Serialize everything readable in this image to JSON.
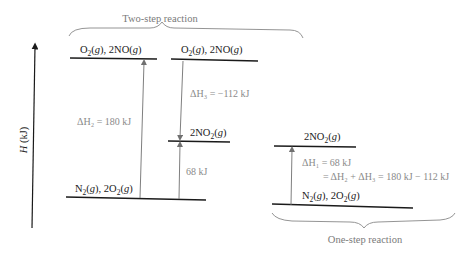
{
  "diagram": {
    "axis": {
      "label": "H (kJ)",
      "label_italic": "H",
      "label_rest": " (kJ)"
    },
    "two_step": {
      "caption": "Two-step reaction",
      "levels": [
        {
          "id": "top_left",
          "label_parts": [
            "O",
            "2",
            "(g), 2NO(g)"
          ]
        },
        {
          "id": "top_right",
          "label_parts": [
            "O",
            "2",
            "(g), 2NO(g)"
          ]
        },
        {
          "id": "mid",
          "label_parts": [
            "2NO",
            "2",
            "(g)"
          ]
        },
        {
          "id": "bottom",
          "label_parts": [
            "N",
            "2",
            "(g), 2O",
            "2",
            "(g)"
          ]
        }
      ],
      "arrows": [
        {
          "id": "dH2",
          "text": "ΔH₂ = 180 kJ",
          "value_kj": 180
        },
        {
          "id": "dH3",
          "text": "ΔH₃ = −112 kJ",
          "value_kj": -112
        },
        {
          "id": "net",
          "text": "68 kJ",
          "value_kj": 68
        }
      ]
    },
    "one_step": {
      "caption": "One-step reaction",
      "levels": [
        {
          "id": "top",
          "label_parts": [
            "2NO",
            "2",
            "(g)"
          ]
        },
        {
          "id": "bottom",
          "label_parts": [
            "N",
            "2",
            "(g), 2O",
            "2",
            "(g)"
          ]
        }
      ],
      "arrow": {
        "line1": "ΔH₁ = 68 kJ",
        "line2": "= ΔH₂ + ΔH₃ = 180 kJ − 112 kJ",
        "value_kj": 68
      }
    },
    "colors": {
      "level_line": "#1a1a1a",
      "arrow": "#707070",
      "annotation": "#8a8a8a"
    }
  }
}
